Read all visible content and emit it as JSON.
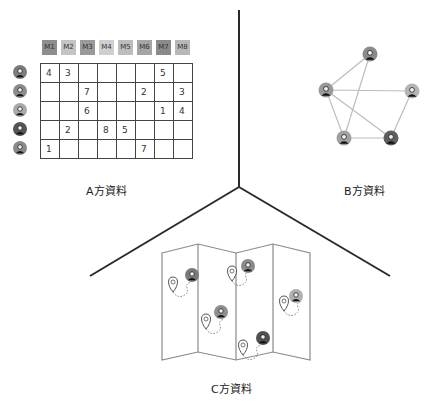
{
  "panels": {
    "a": {
      "label": "A方資料",
      "movies": [
        "M1",
        "M2",
        "M3",
        "M4",
        "M5",
        "M6",
        "M7",
        "M8"
      ],
      "movie_shades": [
        "#8e8e8e",
        "#c4c4c4",
        "#9a9a9a",
        "#cfcfcf",
        "#bdbdbd",
        "#a5a5a5",
        "#8a8a8a",
        "#b8b8b8"
      ],
      "users": [
        {
          "name": "user-1",
          "shade": "#7c7c7c"
        },
        {
          "name": "user-2",
          "shade": "#8c8c8c"
        },
        {
          "name": "user-3",
          "shade": "#a9a9a9"
        },
        {
          "name": "user-4",
          "shade": "#555555"
        },
        {
          "name": "user-5",
          "shade": "#8a8a8a"
        }
      ],
      "ratings": [
        [
          "4",
          "3",
          "",
          "",
          "",
          "",
          "5",
          ""
        ],
        [
          "",
          "",
          "7",
          "",
          "",
          "2",
          "",
          "3"
        ],
        [
          "",
          "",
          "6",
          "",
          "",
          "",
          "1",
          "4"
        ],
        [
          "",
          "2",
          "",
          "8",
          "5",
          "",
          "",
          ""
        ],
        [
          "1",
          "",
          "",
          "",
          "",
          "7",
          "",
          ""
        ]
      ]
    },
    "b": {
      "label": "B方資料",
      "nodes": [
        {
          "id": "top",
          "x": 370,
          "y": 54,
          "shade": "#8a8a8a"
        },
        {
          "id": "left",
          "x": 326,
          "y": 90,
          "shade": "#9a9a9a"
        },
        {
          "id": "right",
          "x": 412,
          "y": 91,
          "shade": "#b5b5b5"
        },
        {
          "id": "bottom-left",
          "x": 344,
          "y": 138,
          "shade": "#a0a0a0"
        },
        {
          "id": "bottom-right",
          "x": 391,
          "y": 138,
          "shade": "#5e5e5e"
        }
      ],
      "edges": [
        [
          "top",
          "left"
        ],
        [
          "top",
          "bottom-left"
        ],
        [
          "left",
          "right"
        ],
        [
          "left",
          "bottom-left"
        ],
        [
          "left",
          "bottom-right"
        ],
        [
          "right",
          "bottom-right"
        ],
        [
          "bottom-left",
          "bottom-right"
        ]
      ]
    },
    "c": {
      "label": "C方資料",
      "locations": [
        {
          "pin_x": 173,
          "pin_y": 283,
          "avatar_x": 192,
          "avatar_y": 275,
          "shade": "#7a7a7a"
        },
        {
          "pin_x": 232,
          "pin_y": 272,
          "avatar_x": 248,
          "avatar_y": 266,
          "shade": "#8a8a8a"
        },
        {
          "pin_x": 206,
          "pin_y": 320,
          "avatar_x": 221,
          "avatar_y": 312,
          "shade": "#8f8f8f"
        },
        {
          "pin_x": 284,
          "pin_y": 302,
          "avatar_x": 296,
          "avatar_y": 296,
          "shade": "#b0b0b0"
        },
        {
          "pin_x": 243,
          "pin_y": 346,
          "avatar_x": 263,
          "avatar_y": 338,
          "shade": "#505050"
        }
      ]
    }
  },
  "colors": {
    "divider": "#2a2a2a",
    "edge": "#bdbdbd",
    "map_stroke": "#8a8a8a",
    "grid_stroke": "#444444"
  }
}
